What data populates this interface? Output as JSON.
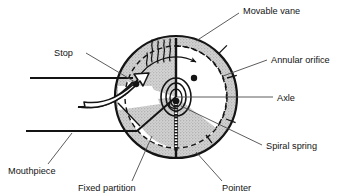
{
  "figure": {
    "kind": "cross-section-diagram",
    "background_color": "#ffffff",
    "line_color": "#141414",
    "shade_color": "#c9c9c9",
    "leader_color": "#4a4a4a"
  },
  "labels": {
    "movable_vane": "Movable vane",
    "annular_orifice": "Annular orifice",
    "axle": "Axle",
    "spiral_spring": "Spiral spring",
    "pointer": "Pointer",
    "fixed_partition": "Fixed partition",
    "mouthpiece": "Mouthpiece",
    "stop": "Stop"
  },
  "parts": [
    {
      "id": "movable-vane",
      "label": "Movable vane",
      "label_x": 243,
      "label_y": 14,
      "anchor": "start",
      "leader": "M239,13 L196,41"
    },
    {
      "id": "annular-orifice",
      "label": "Annular orifice",
      "label_x": 271,
      "label_y": 62,
      "anchor": "start",
      "leader": "M267,60 L223,76"
    },
    {
      "id": "axle",
      "label": "Axle",
      "label_x": 277,
      "label_y": 100,
      "anchor": "start",
      "leader": "M273,97 L177,97"
    },
    {
      "id": "spiral-spring",
      "label": "Spiral spring",
      "label_x": 266,
      "label_y": 148,
      "anchor": "start",
      "leader": "M262,145 L181,106"
    },
    {
      "id": "pointer",
      "label": "Pointer",
      "label_x": 222,
      "label_y": 188,
      "anchor": "start",
      "leader": "M222,181 L196,152"
    },
    {
      "id": "fixed-partition",
      "label": "Fixed partition",
      "label_x": 78,
      "label_y": 188,
      "anchor": "start",
      "leader": "M132,181 L152,136"
    },
    {
      "id": "mouthpiece",
      "label": "Mouthpiece",
      "label_x": 8,
      "label_y": 172,
      "anchor": "start",
      "leader": "M48,164 L72,133"
    },
    {
      "id": "stop",
      "label": "Stop",
      "label_x": 54,
      "label_y": 55,
      "anchor": "start",
      "leader": "M86,53 L135,82"
    }
  ],
  "geometry": {
    "circle_center_x": 176,
    "circle_center_y": 97,
    "circle_radius": 61,
    "orifice_inner_radius": 51,
    "hub_rx": 15,
    "hub_ry": 19
  }
}
